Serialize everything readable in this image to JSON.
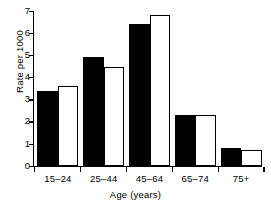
{
  "chart_data": {
    "type": "bar",
    "title": "",
    "xlabel": "Age (years)",
    "ylabel": "Rate per 1000",
    "categories": [
      "15–24",
      "25–44",
      "45–64",
      "65–74",
      "75+"
    ],
    "series": [
      {
        "name": "solid",
        "fill": "#000000",
        "values": [
          3.4,
          4.9,
          6.4,
          2.3,
          0.8
        ]
      },
      {
        "name": "hollow",
        "fill": "#ffffff",
        "values": [
          3.6,
          4.45,
          6.8,
          2.3,
          0.7
        ]
      }
    ],
    "ylim": [
      0,
      7
    ],
    "yticks": [
      0,
      1,
      2,
      3,
      4,
      5,
      6,
      7
    ],
    "ytick_labels": [
      "0",
      "1",
      "2",
      "3",
      "4",
      "5",
      "6",
      "7"
    ],
    "grid": false,
    "legend": "none",
    "axis_color": "#000000"
  }
}
